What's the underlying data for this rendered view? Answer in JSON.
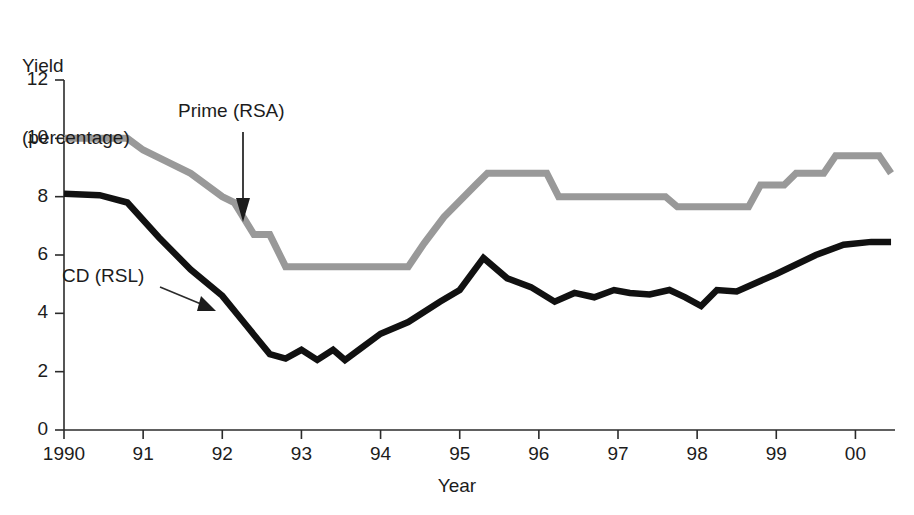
{
  "chart_data": {
    "type": "line",
    "title": "",
    "ylabel": "Yield\n(percentage)",
    "ylabel_line1": "Yield",
    "ylabel_line2": "(percentage)",
    "xlabel": "Year",
    "ylim": [
      0,
      12
    ],
    "xlim": [
      1990,
      2000.5
    ],
    "yticks": [
      0,
      2,
      4,
      6,
      8,
      10,
      12
    ],
    "ytick_labels": [
      "0",
      "2",
      "4",
      "6",
      "8",
      "10",
      "12"
    ],
    "xticks": [
      1990,
      1991,
      1992,
      1993,
      1994,
      1995,
      1996,
      1997,
      1998,
      1999,
      2000
    ],
    "xtick_labels": [
      "1990",
      "91",
      "92",
      "93",
      "94",
      "95",
      "96",
      "97",
      "98",
      "99",
      "00"
    ],
    "grid": false,
    "legend_position": "inline-annotations",
    "series": [
      {
        "name": "Prime (RSA)",
        "color": "#999999",
        "style": "step",
        "x": [
          1990.0,
          1990.8,
          1991.0,
          1991.3,
          1991.6,
          1992.0,
          1992.15,
          1992.4,
          1992.6,
          1992.8,
          1994.35,
          1994.55,
          1994.8,
          1995.2,
          1995.35,
          1996.1,
          1996.25,
          1997.6,
          1997.75,
          1998.65,
          1998.8,
          1999.1,
          1999.25,
          1999.6,
          1999.75,
          2000.3,
          2000.45
        ],
        "y": [
          10.0,
          10.0,
          9.6,
          9.2,
          8.8,
          8.0,
          7.8,
          6.7,
          6.7,
          5.6,
          5.6,
          6.4,
          7.3,
          8.4,
          8.8,
          8.8,
          8.0,
          8.0,
          7.65,
          7.65,
          8.4,
          8.4,
          8.8,
          8.8,
          9.4,
          9.4,
          8.8
        ]
      },
      {
        "name": "CD (RSL)",
        "color": "#111111",
        "style": "line",
        "x": [
          1990.0,
          1990.45,
          1990.8,
          1991.2,
          1991.6,
          1992.0,
          1992.3,
          1992.6,
          1992.8,
          1993.0,
          1993.2,
          1993.4,
          1993.55,
          1993.75,
          1994.0,
          1994.35,
          1994.75,
          1995.0,
          1995.3,
          1995.6,
          1995.9,
          1996.2,
          1996.45,
          1996.7,
          1996.95,
          1997.15,
          1997.4,
          1997.65,
          1997.85,
          1998.05,
          1998.25,
          1998.5,
          1999.0,
          1999.5,
          1999.85,
          2000.2,
          2000.45
        ],
        "y": [
          8.1,
          8.05,
          7.8,
          6.6,
          5.5,
          4.6,
          3.6,
          2.6,
          2.45,
          2.75,
          2.4,
          2.75,
          2.4,
          2.8,
          3.3,
          3.7,
          4.4,
          4.8,
          5.9,
          5.2,
          4.9,
          4.4,
          4.7,
          4.55,
          4.8,
          4.7,
          4.65,
          4.8,
          4.55,
          4.25,
          4.8,
          4.75,
          5.35,
          6.0,
          6.35,
          6.45,
          6.45
        ]
      }
    ],
    "annotations": [
      {
        "text": "Prime (RSA)",
        "series": "Prime (RSA)",
        "arrow": "down"
      },
      {
        "text": "CD (RSL)",
        "series": "CD (RSL)",
        "arrow": "diagonal-down-right"
      }
    ]
  },
  "axes": {
    "y_title_line1": "Yield",
    "y_title_line2": "(percentage)",
    "x_title": "Year"
  },
  "colors": {
    "prime_line": "#999999",
    "cd_line": "#111111",
    "axis": "#2b2b2b",
    "background": "#ffffff"
  }
}
